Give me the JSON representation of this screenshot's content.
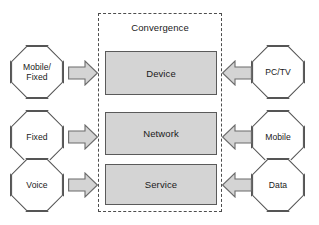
{
  "diagram": {
    "title": "Convergence",
    "center_layers": [
      {
        "id": "device",
        "label": "Device"
      },
      {
        "id": "network",
        "label": "Network"
      },
      {
        "id": "service",
        "label": "Service"
      }
    ],
    "left_nodes": [
      {
        "id": "mobile-fixed",
        "label": "Mobile/\nFixed"
      },
      {
        "id": "fixed",
        "label": "Fixed"
      },
      {
        "id": "voice",
        "label": "Voice"
      }
    ],
    "right_nodes": [
      {
        "id": "pc-tv",
        "label": "PC/TV"
      },
      {
        "id": "mobile",
        "label": "Mobile"
      },
      {
        "id": "data",
        "label": "Data"
      }
    ],
    "arrows": [
      {
        "id": "left-1",
        "direction": "right",
        "icon": "block-arrow-right-icon"
      },
      {
        "id": "left-2",
        "direction": "right",
        "icon": "block-arrow-right-icon"
      },
      {
        "id": "left-3",
        "direction": "right",
        "icon": "block-arrow-right-icon"
      },
      {
        "id": "right-1",
        "direction": "left",
        "icon": "block-arrow-left-icon"
      },
      {
        "id": "right-2",
        "direction": "left",
        "icon": "block-arrow-left-icon"
      },
      {
        "id": "right-3",
        "direction": "left",
        "icon": "block-arrow-left-icon"
      }
    ],
    "colors": {
      "layer_fill": "#d4d4d4",
      "layer_stroke": "#5a5a5a",
      "node_fill": "#ffffff",
      "node_stroke": "#555555",
      "arrow_fill": "#d4d4d4",
      "arrow_stroke": "#6b6b6b",
      "dashed_border": "#4d4d4d",
      "background": "#ffffff",
      "text": "#1a1a1a"
    }
  }
}
